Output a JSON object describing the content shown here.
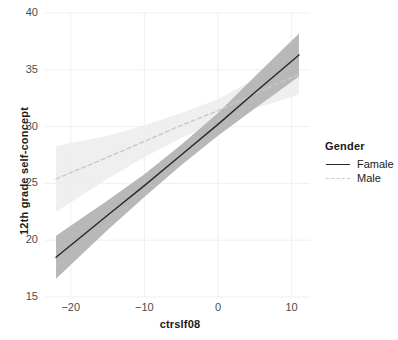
{
  "chart_data": {
    "type": "line",
    "title": "",
    "xlabel": "ctrslf08",
    "ylabel": "12th grade self-concept",
    "xlim": [
      -23.5,
      12.5
    ],
    "ylim": [
      15,
      40
    ],
    "xticks": [
      -20,
      -10,
      0,
      10
    ],
    "yticks": [
      15,
      20,
      25,
      30,
      35,
      40
    ],
    "grid": true,
    "legend": {
      "title": "Gender",
      "position": "right",
      "entries": [
        {
          "name": "Famale",
          "linestyle": "solid",
          "color": "#2b2b2b"
        },
        {
          "name": "Male",
          "linestyle": "dashed",
          "color": "#c9c9c9"
        }
      ]
    },
    "series": [
      {
        "name": "Famale",
        "linestyle": "solid",
        "color": "#2b2b2b",
        "ribbon_color": "#b4b4b4",
        "x": [
          -22,
          -15,
          -10,
          -5,
          0,
          5,
          11
        ],
        "y": [
          18.5,
          22.2,
          24.8,
          27.5,
          30.2,
          33.0,
          36.3
        ],
        "ci_lower": [
          16.6,
          20.9,
          23.8,
          26.6,
          29.2,
          31.6,
          34.4
        ],
        "ci_upper": [
          20.4,
          23.5,
          25.8,
          28.4,
          31.2,
          34.4,
          38.2
        ]
      },
      {
        "name": "Male",
        "linestyle": "dashed",
        "color": "#c9c9c9",
        "ribbon_color": "#ececec",
        "x": [
          -22,
          -15,
          -10,
          -5,
          0,
          5,
          11
        ],
        "y": [
          25.4,
          27.3,
          28.7,
          30.1,
          31.4,
          32.9,
          34.6
        ],
        "ci_lower": [
          22.5,
          25.4,
          27.3,
          29.0,
          30.4,
          31.6,
          32.8
        ],
        "ci_upper": [
          28.3,
          29.2,
          30.1,
          31.2,
          32.4,
          34.2,
          36.4
        ]
      }
    ]
  },
  "axes": {
    "x_label": "ctrslf08",
    "y_label": "12th grade self-concept",
    "x_tick_labels": [
      "−20",
      "−10",
      "0",
      "10"
    ],
    "y_tick_labels": [
      "15",
      "20",
      "25",
      "30",
      "35",
      "40"
    ]
  },
  "legend": {
    "title": "Gender",
    "items": [
      {
        "label": "Famale"
      },
      {
        "label": "Male"
      }
    ]
  }
}
